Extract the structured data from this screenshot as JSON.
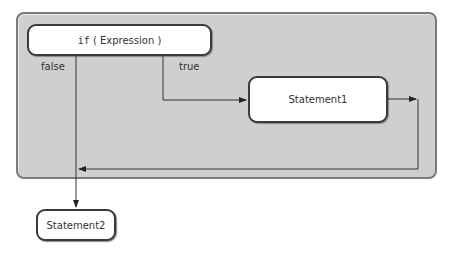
{
  "diagram": {
    "type": "flowchart",
    "nodes": {
      "condition": {
        "keyword": "if",
        "expression": "( Expression )"
      },
      "statement1": "Statement1",
      "statement2": "Statement2"
    },
    "edge_labels": {
      "false": "false",
      "true": "true"
    },
    "colors": {
      "panel_fill": "#cfcfcf",
      "panel_border": "#7a7a7a",
      "box_border": "#3a3a3a",
      "line": "#333333"
    }
  }
}
